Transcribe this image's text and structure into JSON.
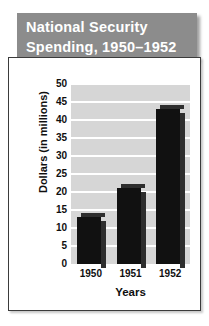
{
  "title": {
    "line1": "National Security",
    "line2": "Spending,  1950–1952",
    "banner_color": "#8c8c8c",
    "text_color": "#ffffff"
  },
  "chart_data": {
    "type": "bar",
    "title": "National Security Spending, 1950–1952",
    "categories": [
      "1950",
      "1951",
      "1952"
    ],
    "values": [
      13,
      21,
      43
    ],
    "xlabel": "Years",
    "ylabel": "Dollars (in millions)",
    "ylim": [
      0,
      50
    ],
    "ytick_step": 5,
    "yticks": [
      "0",
      "5",
      "10",
      "15",
      "20",
      "25",
      "30",
      "35",
      "40",
      "45",
      "50"
    ],
    "grid": true,
    "gridline_color": "#ffffff",
    "plot_background": "#d6d6d6",
    "bar_color": "#111111",
    "bar_shadow_color": "#2e2e2e",
    "legend": null,
    "legend_position": "none"
  }
}
